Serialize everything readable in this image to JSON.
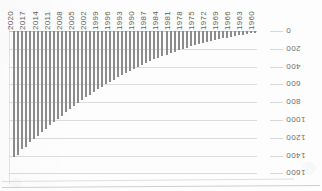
{
  "figure": {
    "background_color": "#fdfdfd",
    "bar_color": "#8c8c8c",
    "gridline_color": "#dcdcdc",
    "orientation_note": "scanned page printed upside-down; all axis text renders rotated 180 degrees"
  },
  "chart_data": {
    "type": "bar",
    "title": "",
    "xlabel": "",
    "ylabel": "",
    "grid": true,
    "legend": "none",
    "ylim": [
      0,
      1600
    ],
    "ytick_labels": [
      "0",
      "200",
      "400",
      "600",
      "800",
      "1000",
      "1200",
      "1400",
      "1600"
    ],
    "ytick_values": [
      0,
      200,
      400,
      600,
      800,
      1000,
      1200,
      1400,
      1600
    ],
    "xtick_labels": [
      "2020",
      "2017",
      "2014",
      "2011",
      "2008",
      "2005",
      "2002",
      "1999",
      "1996",
      "1993",
      "1990",
      "1987",
      "1984",
      "1981",
      "1978",
      "1975",
      "1972",
      "1969",
      "1966",
      "1963",
      "1960"
    ],
    "categories": [
      "2020",
      "2019",
      "2018",
      "2017",
      "2016",
      "2015",
      "2014",
      "2013",
      "2012",
      "2011",
      "2010",
      "2009",
      "2008",
      "2007",
      "2006",
      "2005",
      "2004",
      "2003",
      "2002",
      "2001",
      "2000",
      "1999",
      "1998",
      "1997",
      "1996",
      "1995",
      "1994",
      "1993",
      "1992",
      "1991",
      "1990",
      "1989",
      "1988",
      "1987",
      "1986",
      "1985",
      "1984",
      "1983",
      "1982",
      "1981",
      "1980",
      "1979",
      "1978",
      "1977",
      "1976",
      "1975",
      "1974",
      "1973",
      "1972",
      "1971",
      "1970",
      "1969",
      "1968",
      "1967",
      "1966",
      "1965",
      "1964",
      "1963",
      "1962",
      "1961",
      "1960"
    ],
    "values": [
      1420,
      1390,
      1330,
      1300,
      1250,
      1215,
      1180,
      1140,
      1100,
      1060,
      1025,
      985,
      950,
      915,
      880,
      845,
      810,
      780,
      745,
      715,
      685,
      655,
      625,
      600,
      570,
      545,
      520,
      495,
      470,
      450,
      425,
      405,
      385,
      360,
      340,
      320,
      300,
      282,
      265,
      248,
      232,
      216,
      200,
      186,
      172,
      158,
      146,
      134,
      122,
      112,
      102,
      92,
      83,
      74,
      66,
      58,
      50,
      42,
      34,
      26,
      18
    ]
  }
}
